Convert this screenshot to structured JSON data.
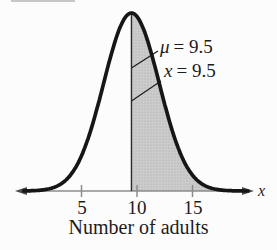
{
  "chart_data": {
    "type": "area",
    "curve": "normal-distribution",
    "title": "",
    "xlabel": "Number of adults",
    "x_axis_arrow_label": "x",
    "mean": 9.5,
    "std": 2.5,
    "shade_from": 9.5,
    "shade_to": 20.6,
    "x_ticks": [
      5,
      10,
      15
    ],
    "x_view_range": [
      -0.2,
      20.0
    ],
    "annotations": [
      {
        "var": "μ",
        "rest": "= 9.5",
        "label": "μ = 9.5",
        "target_x": 9.5
      },
      {
        "var": "x",
        "rest": "= 9.5",
        "label": "x = 9.5",
        "target_x": 9.5
      }
    ],
    "legend": null,
    "grid": false,
    "colors": {
      "curve": "#161616",
      "shade_fill": "#cccccc",
      "shade_dot": "#a6a6a6",
      "axis": "#8c8c8c",
      "arrow": "#4d4d4d",
      "text": "#1c1c1c",
      "mean_line": "#2a2a2a",
      "leader_line": "#1c1c1c"
    }
  }
}
